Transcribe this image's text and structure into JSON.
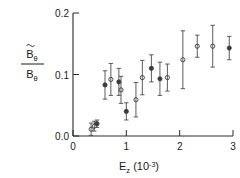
{
  "chart_data": {
    "type": "scatter",
    "title": "",
    "xlabel": "E_z (10^-3)",
    "ylabel": "B~_theta / B_theta",
    "xlim": [
      0,
      3
    ],
    "ylim": [
      0.0,
      0.2
    ],
    "xticks": [
      0,
      1,
      2,
      3
    ],
    "xticklabels": [
      "0",
      "1",
      "2",
      "3"
    ],
    "yticks": [
      0.0,
      0.1,
      0.2
    ],
    "yticklabels": [
      "0.0",
      "0.1",
      "0.2"
    ],
    "grid": false,
    "legend": false,
    "errorbars": "y",
    "marker": "open-circle",
    "points": [
      {
        "x": 0.34,
        "y": 0.011,
        "yerr": 0.01,
        "marker": "open-circle"
      },
      {
        "x": 0.4,
        "y": 0.016,
        "yerr": 0.008,
        "marker": "open-circle"
      },
      {
        "x": 0.45,
        "y": 0.02,
        "yerr": 0.006,
        "marker": "filled-circle"
      },
      {
        "x": 0.6,
        "y": 0.083,
        "yerr": 0.023,
        "marker": "filled-circle"
      },
      {
        "x": 0.71,
        "y": 0.092,
        "yerr": 0.026,
        "marker": "open-circle"
      },
      {
        "x": 0.86,
        "y": 0.088,
        "yerr": 0.022,
        "marker": "filled-circle"
      },
      {
        "x": 0.9,
        "y": 0.075,
        "yerr": 0.022,
        "marker": "open-circle"
      },
      {
        "x": 1.0,
        "y": 0.04,
        "yerr": 0.014,
        "marker": "filled-circle"
      },
      {
        "x": 1.18,
        "y": 0.059,
        "yerr": 0.028,
        "marker": "open-circle"
      },
      {
        "x": 1.3,
        "y": 0.095,
        "yerr": 0.028,
        "marker": "open-circle"
      },
      {
        "x": 1.47,
        "y": 0.11,
        "yerr": 0.022,
        "marker": "filled-circle"
      },
      {
        "x": 1.63,
        "y": 0.093,
        "yerr": 0.027,
        "marker": "filled-circle"
      },
      {
        "x": 1.77,
        "y": 0.095,
        "yerr": 0.022,
        "marker": "open-circle"
      },
      {
        "x": 2.06,
        "y": 0.124,
        "yerr": 0.047,
        "marker": "open-circle"
      },
      {
        "x": 2.33,
        "y": 0.146,
        "yerr": 0.018,
        "marker": "open-circle"
      },
      {
        "x": 2.62,
        "y": 0.146,
        "yerr": 0.034,
        "marker": "open-circle"
      },
      {
        "x": 2.93,
        "y": 0.143,
        "yerr": 0.019,
        "marker": "filled-circle"
      }
    ]
  },
  "axis": {
    "x_label_main": "E",
    "x_label_sub": "z",
    "x_label_unit_open": " (10",
    "x_label_exp": "-3",
    "x_label_unit_close": ")",
    "y_numerator_main": "B",
    "y_numerator_sub": "θ",
    "y_denominator_main": "B",
    "y_denominator_sub": "θ"
  },
  "colors": {
    "axis": "#2b2b2b",
    "marker": "#3a3a3a",
    "errorbar": "#4a4a4a",
    "text": "#1a1a1a",
    "background": "#ffffff"
  }
}
